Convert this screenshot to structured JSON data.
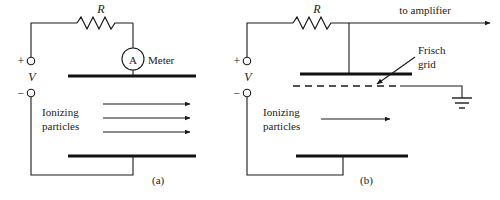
{
  "figure": {
    "type": "circuit-schematic",
    "stroke_color": "#1a1a1a",
    "plate_color": "#111111",
    "background": "#ffffff"
  },
  "panel_a": {
    "label": "(a)",
    "resistor_label": "R",
    "meter_symbol": "A",
    "meter_label": "Meter",
    "source_label": "V",
    "plus_sign": "+",
    "minus_sign": "−",
    "particles_line1": "Ionizing",
    "particles_line2": "particles",
    "arrow_count": 3
  },
  "panel_b": {
    "label": "(b)",
    "resistor_label": "R",
    "output_label": "to amplifier",
    "grid_label_line1": "Frisch",
    "grid_label_line2": "grid",
    "source_label": "V",
    "plus_sign": "+",
    "minus_sign": "−",
    "particles_line1": "Ionizing",
    "particles_line2": "particles",
    "arrow_count": 1,
    "ground_symbol": "earth-ground"
  }
}
